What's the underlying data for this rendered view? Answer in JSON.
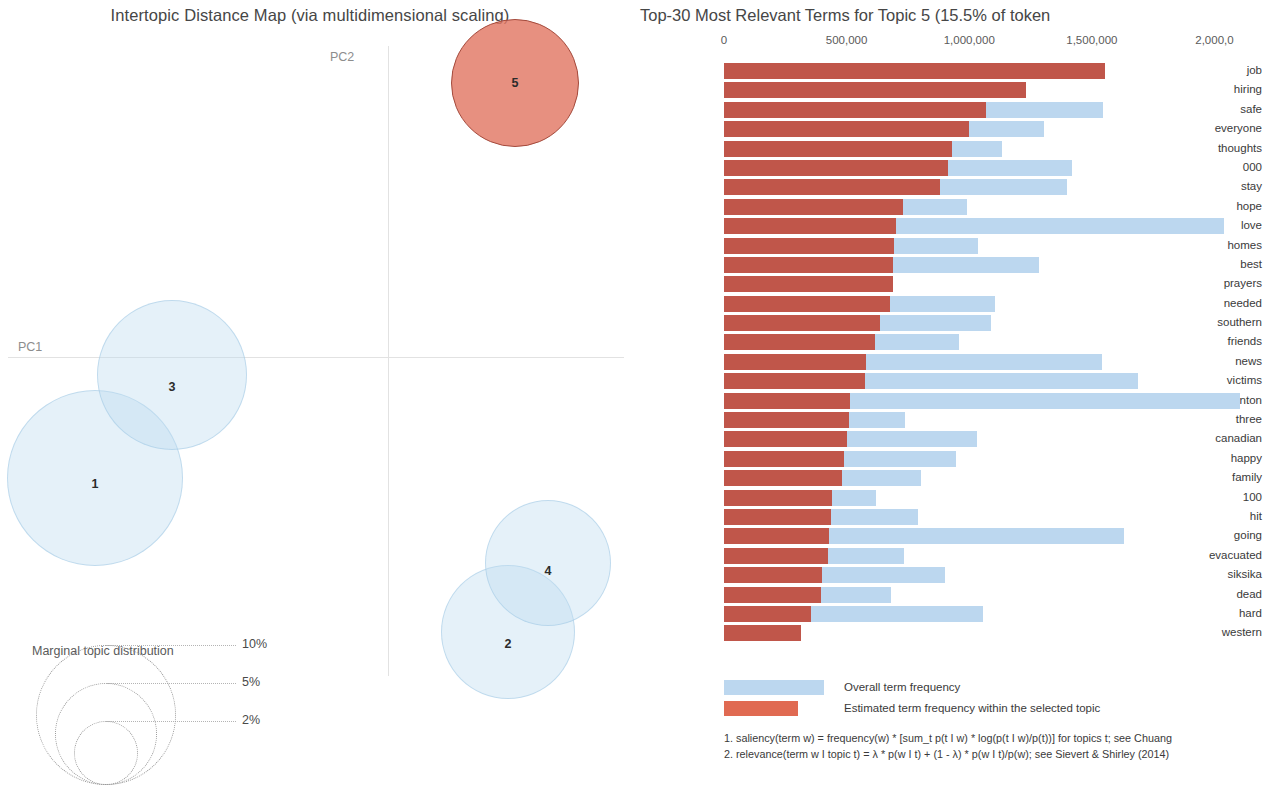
{
  "map": {
    "title": "Intertopic Distance Map (via multidimensional scaling)",
    "axis_x_label": "PC1",
    "axis_y_label": "PC2",
    "selected_color": "#e27864",
    "bubble_color": "#bfddf0",
    "topics": [
      {
        "label": "1",
        "cx": 95,
        "cy": 478,
        "r": 88,
        "selected": false
      },
      {
        "label": "2",
        "cx": 508,
        "cy": 632,
        "r": 67,
        "selected": false
      },
      {
        "label": "3",
        "cx": 172,
        "cy": 375,
        "r": 75,
        "selected": false
      },
      {
        "label": "4",
        "cx": 548,
        "cy": 563,
        "r": 63,
        "selected": false
      },
      {
        "label": "5",
        "cx": 515,
        "cy": 83,
        "r": 64,
        "selected": true
      }
    ],
    "marginal": {
      "title": "Marginal topic distribution",
      "sizes": [
        {
          "label": "2%",
          "r": 32
        },
        {
          "label": "5%",
          "r": 51
        },
        {
          "label": "10%",
          "r": 70
        }
      ]
    }
  },
  "barchart": {
    "title": "Top-30 Most Relevant Terms for Topic 5 (15.5% of token",
    "topic_number": 5,
    "topic_percent": "15.5%",
    "red_color": "#c0564a",
    "blue_color": "#bcd7ef",
    "legend": {
      "overall_label": "Overall term frequency",
      "estimated_label": "Estimated term frequency within the selected topic"
    },
    "footnotes": [
      "1. saliency(term w) = frequency(w) * [sum_t p(t I w) * log(p(t I w)/p(t))] for topics t; see Chuang",
      "2. relevance(term w I topic t) = λ * p(w I t) + (1 - λ) * p(w I t)/p(w); see Sievert & Shirley (2014)"
    ]
  },
  "chart_data": {
    "type": "bar",
    "title": "Top-30 Most Relevant Terms for Topic 5 (15.5% of token",
    "xlabel": "",
    "ylabel": "",
    "orientation": "horizontal",
    "stacked": true,
    "grid": false,
    "legend_position": "bottom",
    "xlim": [
      0,
      2100000
    ],
    "xticks": [
      0,
      500000,
      1000000,
      1500000,
      2000000
    ],
    "xtick_labels": [
      "0",
      "500,000",
      "1,000,000",
      "1,500,000",
      "2,000,0"
    ],
    "categories": [
      "job",
      "hiring",
      "safe",
      "everyone",
      "thoughts",
      "000",
      "stay",
      "hope",
      "love",
      "homes",
      "best",
      "prayers",
      "needed",
      "southern",
      "friends",
      "news",
      "victims",
      "edmonton",
      "three",
      "canadian",
      "happy",
      "family",
      "100",
      "hit",
      "going",
      "evacuated",
      "siksika",
      "dead",
      "hard",
      "western"
    ],
    "series": [
      {
        "name": "Overall term frequency",
        "color": "#bcd7ef",
        "values": [
          1555000,
          1230000,
          1545000,
          1305000,
          1135000,
          1420000,
          1400000,
          990000,
          2040000,
          1035000,
          1285000,
          690000,
          1105000,
          1090000,
          960000,
          1540000,
          1690000,
          2105000,
          740000,
          1030000,
          945000,
          805000,
          620000,
          790000,
          1630000,
          735000,
          900000,
          680000,
          1055000,
          315000
        ]
      },
      {
        "name": "Estimated term frequency within the selected topic",
        "color": "#c0564a",
        "values": [
          1555000,
          1230000,
          1070000,
          1000000,
          930000,
          915000,
          880000,
          730000,
          700000,
          695000,
          690000,
          690000,
          675000,
          635000,
          615000,
          580000,
          575000,
          515000,
          510000,
          500000,
          490000,
          480000,
          440000,
          435000,
          430000,
          425000,
          400000,
          395000,
          355000,
          315000
        ]
      }
    ]
  }
}
